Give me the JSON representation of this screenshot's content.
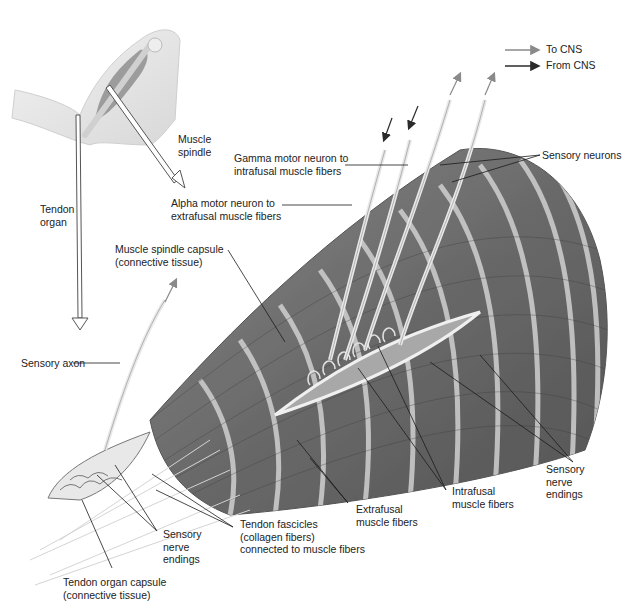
{
  "legend": {
    "items": [
      {
        "label": "To CNS",
        "arrow_color": "#8a8a8a"
      },
      {
        "label": "From CNS",
        "arrow_color": "#2b2b2b"
      }
    ]
  },
  "labels": {
    "muscle_spindle": "Muscle\nspindle",
    "tendon_organ": "Tendon\norgan",
    "gamma_motor_neuron": "Gamma motor neuron to\nintrafusal muscle fibers",
    "sensory_neurons": "Sensory neurons",
    "alpha_motor_neuron": "Alpha motor neuron to\nextrafusal muscle fibers",
    "muscle_spindle_capsule": "Muscle spindle capsule\n(connective tissue)",
    "sensory_axon": "Sensory axon",
    "sensory_nerve_endings_right": "Sensory\nnerve\nendings",
    "intrafusal_muscle_fibers": "Intrafusal\nmuscle fibers",
    "extrafusal_muscle_fibers": "Extrafusal\nmuscle fibers",
    "tendon_fascicles": "Tendon fascicles\n(collagen fibers)\nconnected to muscle fibers",
    "sensory_nerve_endings_left": "Sensory\nnerve\nendings",
    "tendon_organ_capsule": "Tendon organ capsule\n(connective tissue)"
  },
  "colors": {
    "muscle_dark": "#5e5e5e",
    "muscle_mid": "#7a7a7a",
    "stripe_light": "#c9c9c9",
    "nerve": "#e6e6e6",
    "leader_line": "#1a1a1a",
    "skin": "#ececec"
  }
}
